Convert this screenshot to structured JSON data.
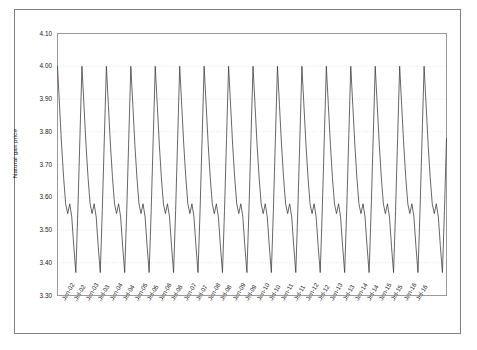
{
  "chart_data": {
    "type": "line",
    "title": "",
    "xlabel": "",
    "ylabel": "Natural gas price",
    "ylim": [
      3.3,
      4.1
    ],
    "ytick_labels": [
      "4.10",
      "4.00",
      "3.90",
      "3.80",
      "3.70",
      "3.60",
      "3.50",
      "3.40",
      "3.30"
    ],
    "ytick_values": [
      4.1,
      4.0,
      3.9,
      3.8,
      3.7,
      3.6,
      3.5,
      3.4,
      3.3
    ],
    "grid": true,
    "grid_orientation": "horizontal",
    "legend": false,
    "line_color": "#404040",
    "xtick_labels": [
      "Jan-02",
      "Jul-02",
      "Jan-03",
      "Jul-03",
      "Jan-04",
      "Jul-04",
      "Jan-05",
      "Jul-05",
      "Jan-06",
      "Jul-06",
      "Jan-07",
      "Jul-07",
      "Jan-08",
      "Jul-08",
      "Jan-09",
      "Jul-09",
      "Jan-10",
      "Jul-10",
      "Jan-11",
      "Jul-11",
      "Jan-12",
      "Jul-12",
      "Jan-13",
      "Jul-13",
      "Jan-14",
      "Jul-14",
      "Jan-15",
      "Jul-15",
      "Jan-16",
      "Jul-16"
    ],
    "series": [
      {
        "name": "Natural gas price",
        "cycle_description": "Annual sawtooth: January peak at 4.00, gradual decline to 3.55, small rebound notch to 3.58, sharp drop to trough 3.37, then steep rise back to January peak.",
        "peak_value": 4.0,
        "trough_value": 3.37,
        "notch_low": 3.55,
        "notch_high": 3.58,
        "final_value": 3.78,
        "values": [
          4.0,
          3.88,
          3.76,
          3.66,
          3.58,
          3.55,
          3.58,
          3.54,
          3.45,
          3.37,
          3.56,
          3.78,
          4.0,
          3.88,
          3.76,
          3.66,
          3.58,
          3.55,
          3.58,
          3.54,
          3.45,
          3.37,
          3.56,
          3.78,
          4.0,
          3.88,
          3.76,
          3.66,
          3.58,
          3.55,
          3.58,
          3.54,
          3.45,
          3.37,
          3.56,
          3.78,
          4.0,
          3.88,
          3.76,
          3.66,
          3.58,
          3.55,
          3.58,
          3.54,
          3.45,
          3.37,
          3.56,
          3.78,
          4.0,
          3.88,
          3.76,
          3.66,
          3.58,
          3.55,
          3.58,
          3.54,
          3.45,
          3.37,
          3.56,
          3.78,
          4.0,
          3.88,
          3.76,
          3.66,
          3.58,
          3.55,
          3.58,
          3.54,
          3.45,
          3.37,
          3.56,
          3.78,
          4.0,
          3.88,
          3.76,
          3.66,
          3.58,
          3.55,
          3.58,
          3.54,
          3.45,
          3.37,
          3.56,
          3.78,
          4.0,
          3.88,
          3.76,
          3.66,
          3.58,
          3.55,
          3.58,
          3.54,
          3.45,
          3.37,
          3.56,
          3.78,
          4.0,
          3.88,
          3.76,
          3.66,
          3.58,
          3.55,
          3.58,
          3.54,
          3.45,
          3.37,
          3.56,
          3.78,
          4.0,
          3.88,
          3.76,
          3.66,
          3.58,
          3.55,
          3.58,
          3.54,
          3.45,
          3.37,
          3.56,
          3.78,
          4.0,
          3.88,
          3.76,
          3.66,
          3.58,
          3.55,
          3.58,
          3.54,
          3.45,
          3.37,
          3.56,
          3.78,
          4.0,
          3.88,
          3.76,
          3.66,
          3.58,
          3.55,
          3.58,
          3.54,
          3.45,
          3.37,
          3.56,
          3.78,
          4.0,
          3.88,
          3.76,
          3.66,
          3.58,
          3.55,
          3.58,
          3.54,
          3.45,
          3.37,
          3.56,
          3.78,
          4.0,
          3.88,
          3.76,
          3.66,
          3.58,
          3.55,
          3.58,
          3.54,
          3.45,
          3.37,
          3.56,
          3.78,
          4.0,
          3.88,
          3.76,
          3.66,
          3.58,
          3.55,
          3.58,
          3.54,
          3.45,
          3.37,
          3.56,
          3.78,
          4.0,
          3.88,
          3.76,
          3.66,
          3.58,
          3.55,
          3.58,
          3.54,
          3.45,
          3.37,
          3.56,
          3.78
        ]
      }
    ]
  }
}
